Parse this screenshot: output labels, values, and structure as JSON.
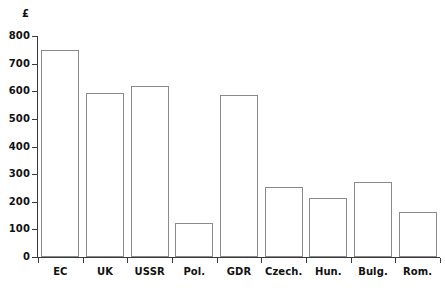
{
  "chart_data": {
    "type": "bar",
    "title": "",
    "subtitle": "",
    "xlabel": "",
    "ylabel": "£",
    "unit_symbol": "£",
    "categories": [
      "EC",
      "UK",
      "USSR",
      "Pol.",
      "GDR",
      "Czech.",
      "Hun.",
      "Bulg.",
      "Rom."
    ],
    "values": [
      750,
      593,
      618,
      123,
      585,
      253,
      214,
      273,
      164
    ],
    "ylim": [
      0,
      800
    ],
    "ytick_step": 100,
    "ytick_labels": [
      "800",
      "700",
      "600",
      "500",
      "400",
      "300",
      "200",
      "100",
      "0"
    ],
    "ytick_values": [
      800,
      700,
      600,
      500,
      400,
      300,
      200,
      100,
      0
    ],
    "grid": false,
    "legend": null,
    "legend_position": "none",
    "bar_style": {
      "fill": "#ffffff",
      "stroke": "#8a8a8a"
    },
    "axis_color": "#3a3a3a",
    "text_color": "#111111",
    "background": "#ffffff"
  }
}
